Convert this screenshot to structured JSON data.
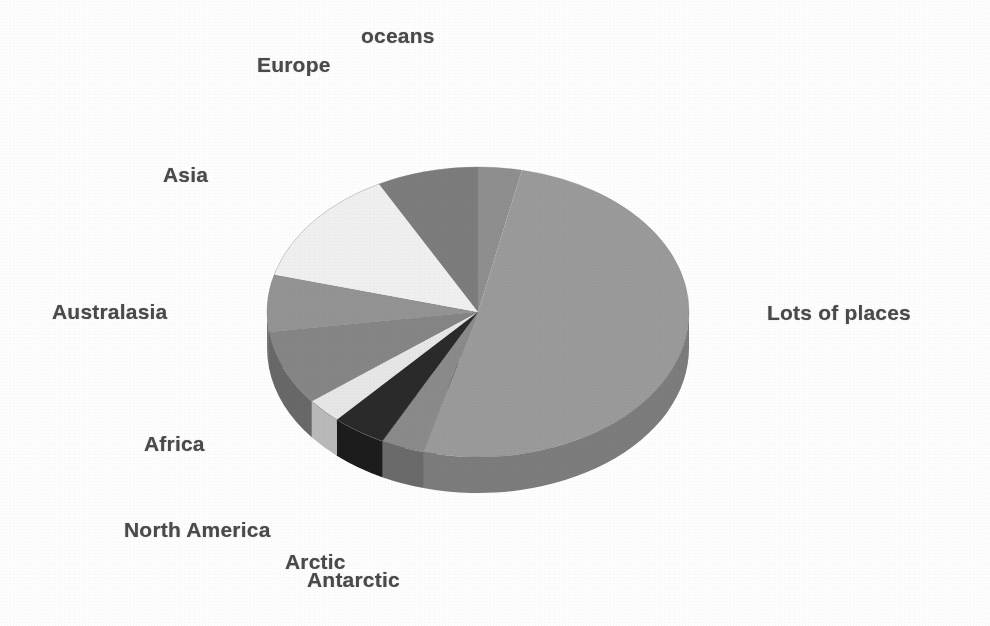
{
  "figure": {
    "background_color": "#fdfdfd",
    "label_color": "#4a4a4a"
  },
  "labels": {
    "oceans": "oceans",
    "europe": "Europe",
    "asia": "Asia",
    "australasia": "Australasia",
    "africa": "Africa",
    "north_america": "North America",
    "arctic": "Arctic",
    "antarctic": "Antarctic",
    "lots_of_places": "Lots of places"
  },
  "chart_data": {
    "type": "pie",
    "title": "",
    "subtitle": "",
    "xlabel": "",
    "ylabel": "",
    "grid": false,
    "legend_position": "none",
    "style": "3d-exploded-none",
    "label_placement": "outside-leaderless",
    "start_angle_deg": 0,
    "direction": "clockwise",
    "categories": [
      "oceans",
      "Lots of places",
      "Antarctic",
      "Arctic",
      "North America",
      "Africa",
      "Australasia",
      "Asia",
      "Europe"
    ],
    "values": [
      3.3,
      50.8,
      3.3,
      4.2,
      2.8,
      8.3,
      6.4,
      13.1,
      7.8
    ],
    "units": "percent",
    "total": 100,
    "slices": [
      {
        "name": "oceans",
        "value": 3.3,
        "start_deg": 0.0,
        "end_deg": 12.0,
        "color": "#8e8e8e",
        "side_color": "#6f6f6f"
      },
      {
        "name": "Lots of places",
        "value": 50.8,
        "start_deg": 12.0,
        "end_deg": 195.0,
        "color": "#9a9a9a",
        "side_color": "#7b7b7b"
      },
      {
        "name": "Antarctic",
        "value": 3.3,
        "start_deg": 195.0,
        "end_deg": 207.0,
        "color": "#8a8a8a",
        "side_color": "#6b6b6b"
      },
      {
        "name": "Arctic",
        "value": 4.2,
        "start_deg": 207.0,
        "end_deg": 222.0,
        "color": "#2b2b2b",
        "side_color": "#1a1a1a"
      },
      {
        "name": "North America",
        "value": 2.8,
        "start_deg": 222.0,
        "end_deg": 232.0,
        "color": "#e6e6e6",
        "side_color": "#b9b9b9"
      },
      {
        "name": "Africa",
        "value": 8.3,
        "start_deg": 232.0,
        "end_deg": 262.0,
        "color": "#858585",
        "side_color": "#676767"
      },
      {
        "name": "Australasia",
        "value": 6.4,
        "start_deg": 262.0,
        "end_deg": 285.0,
        "color": "#939393",
        "side_color": "#747474"
      },
      {
        "name": "Asia",
        "value": 13.1,
        "start_deg": 285.0,
        "end_deg": 332.0,
        "color": "#efefef",
        "side_color": "#c2c2c2"
      },
      {
        "name": "Europe",
        "value": 7.8,
        "start_deg": 332.0,
        "end_deg": 360.0,
        "color": "#7c7c7c",
        "side_color": "#606060"
      }
    ],
    "geometry": {
      "center_x": 478,
      "center_y": 312,
      "radius_x": 211,
      "radius_y": 145,
      "depth": 36
    }
  }
}
